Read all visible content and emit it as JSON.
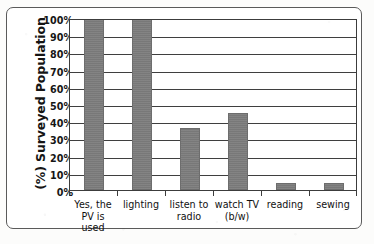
{
  "chart_data": {
    "type": "bar",
    "title": "",
    "subtitle": "",
    "xlabel": "",
    "ylabel": "(%) Surveyed Population",
    "categories": [
      "Yes, the\nPV is used",
      "lighting",
      "listen to\nradio",
      "watch TV\n(b/w)",
      "reading",
      "sewing"
    ],
    "values": [
      100,
      100,
      36,
      45,
      4,
      4
    ],
    "value_labels": [
      "100%",
      "100%",
      "36%",
      "45%",
      "4%",
      "4%"
    ],
    "ylim": [
      0,
      100
    ],
    "ytick_values": [
      0,
      10,
      20,
      30,
      40,
      50,
      60,
      70,
      80,
      90,
      100
    ],
    "ytick_labels": [
      "0%",
      "10%",
      "20%",
      "30%",
      "40%",
      "50%",
      "60%",
      "70%",
      "80%",
      "90%",
      "100%"
    ],
    "grid": true,
    "grid_axis": "y",
    "legend": false,
    "legend_position": "none",
    "bar_color": "#7d7d7d",
    "bar_edge_color": "#6d6d6d",
    "axis_color": "#3c3c3c",
    "grid_color": "#3f3f3f",
    "plot_background": "#ffffff",
    "frame_border_color": "#5a5a5a"
  },
  "figure": {
    "background": "#fcfcfb"
  }
}
